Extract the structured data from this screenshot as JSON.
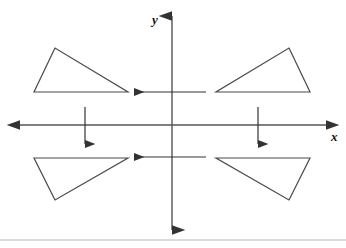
{
  "figure": {
    "width": 346,
    "height": 248,
    "background_color": "#ffffff",
    "stroke_color": "#4a4a4a",
    "axis_color": "#555555",
    "arrow_color": "#333333",
    "rule_color": "#b9b9b9"
  },
  "axes": {
    "x_axis": {
      "label": "x",
      "label_x": 331,
      "label_y": 141,
      "line": {
        "x1": 20,
        "y1": 125,
        "x2": 326,
        "y2": 125
      },
      "arrow_left": "true",
      "arrow_right": "true"
    },
    "y_axis": {
      "label": "y",
      "label_x": 152,
      "label_y": 24,
      "line": {
        "x1": 172,
        "y1": 16,
        "x2": 172,
        "y2": 230
      },
      "arrow_up": "true",
      "arrow_down": "true"
    },
    "origin": {
      "x": 172,
      "y": 125
    }
  },
  "shapes": [
    {
      "name": "triangle-top-left",
      "quadrant": "II",
      "points": "55,48 34,92 128,92"
    },
    {
      "name": "triangle-top-right",
      "quadrant": "I",
      "points": "289,48 310,92 216,92"
    },
    {
      "name": "triangle-bottom-left",
      "quadrant": "III",
      "points": "55,200 34,158 128,158"
    },
    {
      "name": "triangle-bottom-right",
      "quadrant": "IV",
      "points": "289,200 310,158 216,158"
    }
  ],
  "translation_arrows": [
    {
      "name": "arrow-upper-horizontal-left",
      "direction": "left",
      "x1": 206,
      "y1": 92,
      "x2": 134,
      "y2": 92
    },
    {
      "name": "arrow-lower-horizontal-left",
      "direction": "left",
      "x1": 206,
      "y1": 157,
      "x2": 134,
      "y2": 157
    },
    {
      "name": "arrow-left-vertical-down",
      "direction": "down",
      "x1": 85,
      "y1": 107,
      "x2": 85,
      "y2": 144
    },
    {
      "name": "arrow-right-vertical-down",
      "direction": "down",
      "x1": 258,
      "y1": 107,
      "x2": 258,
      "y2": 144
    }
  ],
  "footer_rule": {
    "y": 240,
    "x1": 0,
    "x2": 346
  }
}
